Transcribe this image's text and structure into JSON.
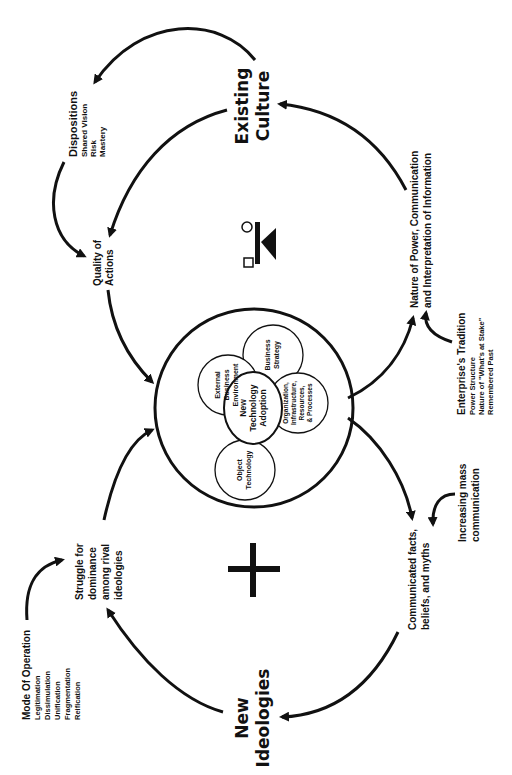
{
  "diagram": {
    "orientation": "rotated-90-ccw",
    "colors": {
      "ink": "#111111",
      "background": "#ffffff"
    },
    "nodes": {
      "existing_culture": {
        "line1": "Existing",
        "line2": "Culture"
      },
      "new_ideologies": {
        "line1": "New",
        "line2": "Ideologies"
      },
      "dispositions": {
        "title": "Dispositions",
        "items": [
          "Shared Vision",
          "Risk",
          "Mastery"
        ]
      },
      "quality_of_actions": {
        "line1": "Quality of",
        "line2": "Actions"
      },
      "nature_of_power": {
        "line1": "Nature of Power, Communication",
        "line2": "and Interpretation of Information"
      },
      "enterprise_tradition": {
        "title": "Enterprise's Tradition",
        "items": [
          "Power Structure",
          "Nature of \"What's at Stake\"",
          "Remembered Past"
        ]
      },
      "increasing_mass_communication": {
        "line1": "Increasing mass",
        "line2": "communication"
      },
      "communicated_facts": {
        "line1": "Communicated facts,",
        "line2": "beliefs, and myths"
      },
      "struggle": {
        "line1": "Struggle for",
        "line2": "dominance",
        "line3": "among rival",
        "line4": "ideologies"
      },
      "mode_of_operation": {
        "title": "Mode Of Operation",
        "items": [
          "Legitimation",
          "Dissimulation",
          "Unification",
          "Fragmentation",
          "Reification"
        ]
      }
    },
    "center": {
      "core": {
        "line1": "New",
        "line2": "Technology",
        "line3": "Adoption"
      },
      "business_strategy": {
        "line1": "Business",
        "line2": "Strategy"
      },
      "external_env": {
        "line1": "External",
        "line2": "Business",
        "line3": "Environment"
      },
      "organization": {
        "line1": "Organization,",
        "line2": "Infrastructure,",
        "line3": "Resources,",
        "line4": "& Processes"
      },
      "object_technology": {
        "line1": "Object",
        "line2": "Technology"
      }
    },
    "symbols": {
      "top": "gender-balance-symbol",
      "bottom": "plus-symbol"
    }
  }
}
